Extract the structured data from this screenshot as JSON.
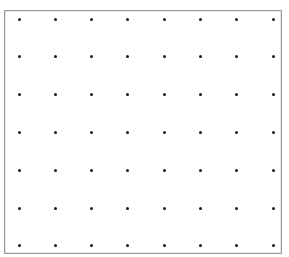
{
  "grid": {
    "columns": 8,
    "rows": 7,
    "origin_x": 19,
    "origin_y": 19,
    "spacing_x": 36.3,
    "spacing_y": 37.8,
    "dot_color": "#1a1a1a",
    "border_color": "#9a9a9a"
  }
}
